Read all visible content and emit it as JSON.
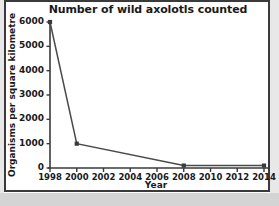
{
  "chart_data": {
    "type": "line",
    "title": "Number of wild axolotls counted",
    "xlabel": "Year",
    "ylabel": "Organisms per square kilometre",
    "x": [
      1998,
      2000,
      2008,
      2014
    ],
    "values": [
      6000,
      1000,
      100,
      100
    ],
    "points": [
      {
        "x": 1998,
        "y": 6000
      },
      {
        "x": 2000,
        "y": 1000
      },
      {
        "x": 2008,
        "y": 100
      },
      {
        "x": 2014,
        "y": 100
      }
    ],
    "xlim": [
      1998,
      2014
    ],
    "ylim": [
      0,
      6000
    ],
    "xticks": [
      1998,
      2000,
      2002,
      2004,
      2006,
      2008,
      2010,
      2012,
      2014
    ],
    "xtick_labels": [
      "1998",
      "2000",
      "2002",
      "2004",
      "2006",
      "2008",
      "2010",
      "2012",
      "2014"
    ],
    "yticks": [
      0,
      1000,
      2000,
      3000,
      4000,
      5000,
      6000
    ],
    "ytick_labels": [
      "0",
      "1000",
      "2000",
      "3000",
      "4000",
      "5000",
      "6000"
    ],
    "grid": false,
    "legend": false,
    "marker": "square",
    "line_color": "#4a4a4a",
    "marker_color": "#3a3a3a",
    "axis_color": "#3a3a3a",
    "background": "#ffffff"
  }
}
